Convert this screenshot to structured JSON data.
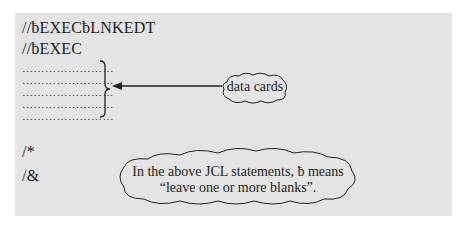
{
  "jcl": {
    "line1": "//ƀEXECƀLNKEDT",
    "line2": "//ƀEXEC",
    "data_rows": [
      "……………………",
      "……………………",
      "……………………",
      "……………………",
      "……………………"
    ],
    "end_data": "/*",
    "end_job": "/&"
  },
  "callouts": {
    "data_cards": "data cards",
    "note_line1": "In the above JCL statements, ƀ means",
    "note_line2": "“leave one or more blanks”."
  },
  "colors": {
    "panel": "#e4e4e4",
    "ink": "#1e1e1e"
  }
}
